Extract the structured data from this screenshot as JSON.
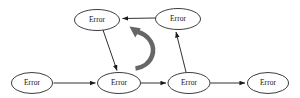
{
  "diagram": {
    "type": "directed-graph",
    "title": "",
    "background_color": "#ffffff",
    "node_fill": "#ffffff",
    "node_stroke": "#1a1a1a",
    "edge_color": "#1a1a1a",
    "cycle_arrow_color": "#666666",
    "nodes": [
      {
        "id": "n1",
        "label": "Error",
        "cx": 97,
        "cy": 20,
        "rx": 22.5,
        "ry": 10.5
      },
      {
        "id": "n2",
        "label": "Error",
        "cx": 178,
        "cy": 19,
        "rx": 22.5,
        "ry": 10.5
      },
      {
        "id": "n3",
        "label": "Error",
        "cx": 32,
        "cy": 83,
        "rx": 20.5,
        "ry": 10.5
      },
      {
        "id": "n4",
        "label": "Error",
        "cx": 119,
        "cy": 83,
        "rx": 21.5,
        "ry": 10.5
      },
      {
        "id": "n5",
        "label": "Error",
        "cx": 189,
        "cy": 83,
        "rx": 21.0,
        "ry": 10.5
      },
      {
        "id": "n6",
        "label": "Error",
        "cx": 268,
        "cy": 83,
        "rx": 20.5,
        "ry": 10.5
      }
    ],
    "edges": [
      {
        "id": "e1",
        "from": "n3",
        "to": "n4",
        "direction": "right",
        "kind": "straight"
      },
      {
        "id": "e2",
        "from": "n4",
        "to": "n5",
        "direction": "right",
        "kind": "straight"
      },
      {
        "id": "e3",
        "from": "n5",
        "to": "n6",
        "direction": "right",
        "kind": "straight"
      },
      {
        "id": "e4",
        "from": "n2",
        "to": "n1",
        "direction": "left",
        "kind": "straight"
      },
      {
        "id": "e5",
        "from": "n1",
        "to": "n4",
        "direction": "down",
        "kind": "diagonal"
      },
      {
        "id": "e6",
        "from": "n5",
        "to": "n2",
        "direction": "up",
        "kind": "diagonal"
      }
    ],
    "cycle_arrow": {
      "id": "cycle",
      "label": "",
      "rotation": "counterclockwise",
      "cx": 133,
      "cy": 47,
      "r": 20
    }
  }
}
